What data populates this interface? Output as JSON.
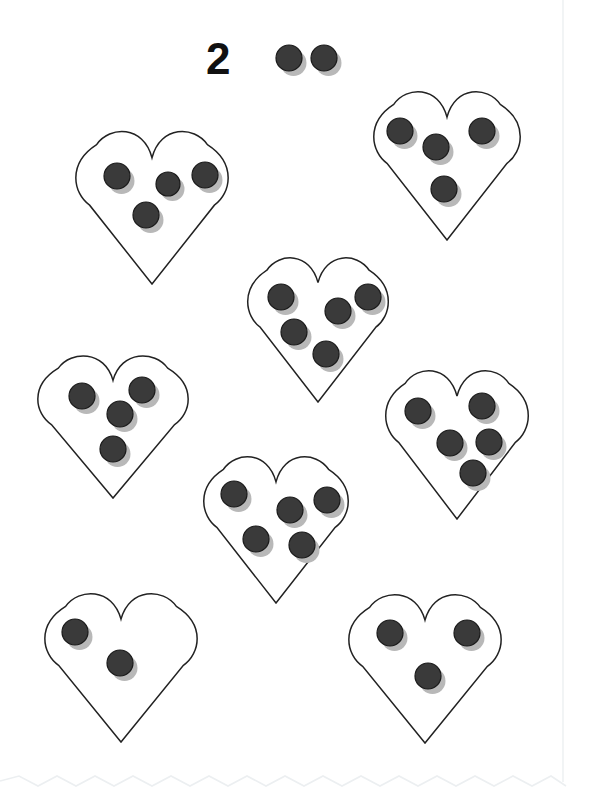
{
  "page": {
    "width": 590,
    "height": 796,
    "background_color": "#ffffff"
  },
  "style": {
    "dot_fill": "#3a3a3a",
    "dot_stroke": "#1a1a1a",
    "dot_shadow": "#b8b8b8",
    "heart_stroke": "#222222",
    "heart_fill": "#ffffff",
    "numeral_color": "#111111",
    "border_color": "#eceff1"
  },
  "header": {
    "numeral_label": "2",
    "numeral_x": 206,
    "numeral_y": 74,
    "reference_dot_count": 2,
    "reference_dots": [
      {
        "cx": 289,
        "cy": 58,
        "r": 13
      },
      {
        "cx": 324,
        "cy": 58,
        "r": 13
      }
    ]
  },
  "hearts": [
    {
      "name": "heart-top-left",
      "cx": 152,
      "top": 138,
      "width": 156,
      "height": 146,
      "count": 4,
      "dots": [
        {
          "cx": 117,
          "cy": 176,
          "r": 13
        },
        {
          "cx": 168,
          "cy": 184,
          "r": 12
        },
        {
          "cx": 205,
          "cy": 175,
          "r": 13
        },
        {
          "cx": 146,
          "cy": 215,
          "r": 13
        }
      ]
    },
    {
      "name": "heart-top-right",
      "cx": 447,
      "top": 98,
      "width": 150,
      "height": 142,
      "count": 4,
      "dots": [
        {
          "cx": 400,
          "cy": 131,
          "r": 13
        },
        {
          "cx": 436,
          "cy": 147,
          "r": 13
        },
        {
          "cx": 482,
          "cy": 131,
          "r": 13
        },
        {
          "cx": 444,
          "cy": 189,
          "r": 13
        }
      ]
    },
    {
      "name": "heart-middle-center",
      "cx": 318,
      "top": 264,
      "width": 144,
      "height": 138,
      "count": 5,
      "dots": [
        {
          "cx": 281,
          "cy": 297,
          "r": 13
        },
        {
          "cx": 338,
          "cy": 311,
          "r": 13
        },
        {
          "cx": 368,
          "cy": 297,
          "r": 13
        },
        {
          "cx": 294,
          "cy": 332,
          "r": 13
        },
        {
          "cx": 326,
          "cy": 354,
          "r": 13
        }
      ]
    },
    {
      "name": "heart-middle-left",
      "cx": 113,
      "top": 362,
      "width": 154,
      "height": 136,
      "count": 4,
      "dots": [
        {
          "cx": 82,
          "cy": 396,
          "r": 13
        },
        {
          "cx": 142,
          "cy": 390,
          "r": 13
        },
        {
          "cx": 120,
          "cy": 414,
          "r": 13
        },
        {
          "cx": 113,
          "cy": 449,
          "r": 13
        }
      ]
    },
    {
      "name": "heart-middle-right",
      "cx": 457,
      "top": 377,
      "width": 146,
      "height": 142,
      "count": 5,
      "dots": [
        {
          "cx": 418,
          "cy": 411,
          "r": 13
        },
        {
          "cx": 482,
          "cy": 406,
          "r": 13
        },
        {
          "cx": 450,
          "cy": 443,
          "r": 13
        },
        {
          "cx": 489,
          "cy": 442,
          "r": 13
        },
        {
          "cx": 473,
          "cy": 473,
          "r": 13
        }
      ]
    },
    {
      "name": "heart-lower-center",
      "cx": 276,
      "top": 463,
      "width": 148,
      "height": 140,
      "count": 5,
      "dots": [
        {
          "cx": 234,
          "cy": 494,
          "r": 13
        },
        {
          "cx": 290,
          "cy": 510,
          "r": 13
        },
        {
          "cx": 327,
          "cy": 500,
          "r": 13
        },
        {
          "cx": 256,
          "cy": 539,
          "r": 13
        },
        {
          "cx": 302,
          "cy": 545,
          "r": 13
        }
      ]
    },
    {
      "name": "heart-bottom-left",
      "cx": 121,
      "top": 600,
      "width": 156,
      "height": 142,
      "count": 2,
      "dots": [
        {
          "cx": 75,
          "cy": 632,
          "r": 13
        },
        {
          "cx": 120,
          "cy": 663,
          "r": 13
        }
      ]
    },
    {
      "name": "heart-bottom-right",
      "cx": 425,
      "top": 601,
      "width": 156,
      "height": 142,
      "count": 3,
      "dots": [
        {
          "cx": 390,
          "cy": 633,
          "r": 13
        },
        {
          "cx": 467,
          "cy": 633,
          "r": 13
        },
        {
          "cx": 428,
          "cy": 676,
          "r": 13
        }
      ]
    }
  ],
  "decorations": {
    "bottom_zigzag": {
      "y": 781,
      "start_x": 0,
      "end_x": 566,
      "amplitude": 5,
      "period": 19
    },
    "right_rule": {
      "x": 563,
      "y_start": 0,
      "y_end": 782
    }
  }
}
